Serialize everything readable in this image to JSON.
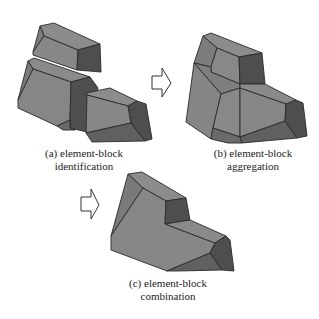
{
  "figure": {
    "panels": [
      {
        "id": "a",
        "caption_line1": "(a) element-block",
        "caption_line2": "identification",
        "block_count": 3
      },
      {
        "id": "b",
        "caption_line1": "(b) element-block",
        "caption_line2": "aggregation",
        "block_count": 1
      },
      {
        "id": "c",
        "caption_line1": "(c) element-block",
        "caption_line2": "combination",
        "block_count": 1
      }
    ],
    "arrows": [
      {
        "from": "a",
        "to": "b",
        "icon": "hollow-right-arrow-icon"
      },
      {
        "from": "b",
        "to": "c",
        "icon": "hollow-right-arrow-icon"
      }
    ],
    "colors": {
      "face_light": "#8c8c8c",
      "face_mid": "#7a7a7a",
      "face_dark": "#4e4e4e",
      "face_darker": "#5e5e5e",
      "edge": "#2a2a2a",
      "arrow_stroke": "#333333",
      "text": "#222222",
      "background": "#ffffff"
    }
  }
}
